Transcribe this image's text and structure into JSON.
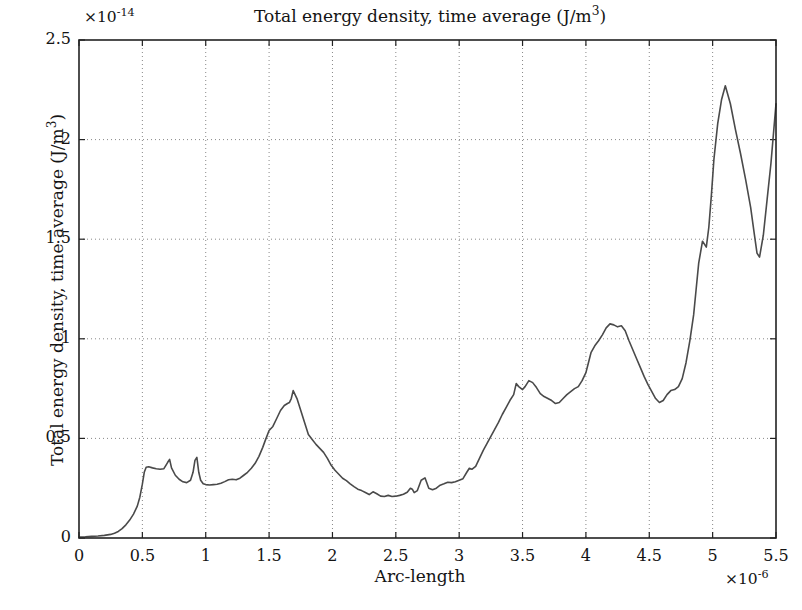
{
  "chart_data": {
    "type": "line",
    "title": "Total energy density, time average (J/m3)",
    "title_html": "Total energy density, time average (J/m<sup>3</sup>)",
    "xlabel": "Arc-length",
    "ylabel": "Total energy density, time average (J/m3)",
    "ylabel_html": "Total energy density, time average (J/m<sup>3</sup>)",
    "x_exponent": "×10⁻⁶",
    "x_exponent_html": "×10<sup>-6</sup>",
    "y_exponent": "×10⁻¹⁴",
    "y_exponent_html": "×10<sup>-14</sup>",
    "xlim": [
      0,
      5.5
    ],
    "ylim": [
      0,
      2.5
    ],
    "xticks": [
      "0",
      "0.5",
      "1",
      "1.5",
      "2",
      "2.5",
      "3",
      "3.5",
      "4",
      "4.5",
      "5",
      "5.5"
    ],
    "xtick_values": [
      0,
      0.5,
      1,
      1.5,
      2,
      2.5,
      3,
      3.5,
      4,
      4.5,
      5,
      5.5
    ],
    "yticks": [
      "0",
      "0.5",
      "1",
      "1.5",
      "2",
      "2.5"
    ],
    "ytick_values": [
      0,
      0.5,
      1,
      1.5,
      2,
      2.5
    ],
    "grid": true,
    "grid_style": "dotted",
    "grid_color": "#888888",
    "line_color": "#4a4a4a",
    "line_width": 1.6,
    "axes_color": "#222222",
    "background": "#ffffff",
    "legend": null,
    "series": [
      {
        "name": "Total energy density",
        "x": [
          0.0,
          0.05,
          0.1,
          0.15,
          0.2,
          0.25,
          0.28,
          0.31,
          0.34,
          0.37,
          0.4,
          0.43,
          0.46,
          0.48,
          0.5,
          0.515,
          0.53,
          0.55,
          0.58,
          0.61,
          0.64,
          0.67,
          0.7,
          0.715,
          0.73,
          0.76,
          0.79,
          0.82,
          0.85,
          0.88,
          0.9,
          0.915,
          0.93,
          0.945,
          0.96,
          0.98,
          1.0,
          1.03,
          1.06,
          1.09,
          1.12,
          1.15,
          1.18,
          1.21,
          1.24,
          1.27,
          1.3,
          1.33,
          1.36,
          1.39,
          1.42,
          1.45,
          1.47,
          1.5,
          1.53,
          1.56,
          1.59,
          1.62,
          1.645,
          1.66,
          1.675,
          1.69,
          1.72,
          1.75,
          1.78,
          1.81,
          1.84,
          1.87,
          1.9,
          1.93,
          1.96,
          1.99,
          2.02,
          2.05,
          2.08,
          2.11,
          2.14,
          2.17,
          2.2,
          2.23,
          2.26,
          2.29,
          2.32,
          2.35,
          2.38,
          2.41,
          2.44,
          2.47,
          2.5,
          2.53,
          2.56,
          2.59,
          2.615,
          2.63,
          2.645,
          2.67,
          2.7,
          2.73,
          2.76,
          2.79,
          2.82,
          2.85,
          2.88,
          2.91,
          2.94,
          2.97,
          3.0,
          3.03,
          3.06,
          3.08,
          3.1,
          3.13,
          3.16,
          3.19,
          3.22,
          3.25,
          3.28,
          3.31,
          3.34,
          3.37,
          3.4,
          3.43,
          3.45,
          3.47,
          3.5,
          3.52,
          3.55,
          3.58,
          3.61,
          3.64,
          3.67,
          3.7,
          3.73,
          3.76,
          3.79,
          3.82,
          3.85,
          3.88,
          3.91,
          3.94,
          3.97,
          4.0,
          4.02,
          4.04,
          4.07,
          4.1,
          4.13,
          4.16,
          4.19,
          4.22,
          4.25,
          4.28,
          4.31,
          4.34,
          4.37,
          4.4,
          4.43,
          4.46,
          4.49,
          4.52,
          4.55,
          4.58,
          4.61,
          4.64,
          4.67,
          4.7,
          4.73,
          4.76,
          4.79,
          4.82,
          4.85,
          4.87,
          4.89,
          4.92,
          4.95,
          4.97,
          4.99,
          5.01,
          5.04,
          5.07,
          5.1,
          5.14,
          5.18,
          5.22,
          5.26,
          5.3,
          5.33,
          5.35,
          5.37,
          5.4,
          5.43,
          5.46,
          5.48,
          5.5
        ],
        "y": [
          0.005,
          0.006,
          0.008,
          0.01,
          0.013,
          0.018,
          0.024,
          0.033,
          0.047,
          0.066,
          0.09,
          0.12,
          0.16,
          0.205,
          0.27,
          0.33,
          0.355,
          0.358,
          0.352,
          0.348,
          0.345,
          0.348,
          0.38,
          0.395,
          0.352,
          0.315,
          0.295,
          0.282,
          0.278,
          0.29,
          0.33,
          0.39,
          0.405,
          0.33,
          0.29,
          0.272,
          0.268,
          0.266,
          0.268,
          0.27,
          0.275,
          0.283,
          0.292,
          0.295,
          0.292,
          0.3,
          0.315,
          0.33,
          0.35,
          0.375,
          0.41,
          0.455,
          0.49,
          0.54,
          0.56,
          0.6,
          0.64,
          0.665,
          0.675,
          0.68,
          0.7,
          0.74,
          0.7,
          0.64,
          0.58,
          0.52,
          0.495,
          0.47,
          0.45,
          0.43,
          0.4,
          0.365,
          0.34,
          0.32,
          0.3,
          0.288,
          0.272,
          0.258,
          0.245,
          0.238,
          0.228,
          0.218,
          0.232,
          0.222,
          0.21,
          0.208,
          0.214,
          0.208,
          0.21,
          0.214,
          0.22,
          0.23,
          0.25,
          0.245,
          0.228,
          0.238,
          0.29,
          0.302,
          0.25,
          0.242,
          0.25,
          0.265,
          0.272,
          0.28,
          0.278,
          0.282,
          0.29,
          0.298,
          0.33,
          0.35,
          0.345,
          0.36,
          0.4,
          0.44,
          0.475,
          0.51,
          0.545,
          0.58,
          0.62,
          0.655,
          0.69,
          0.72,
          0.775,
          0.76,
          0.745,
          0.76,
          0.79,
          0.78,
          0.755,
          0.725,
          0.71,
          0.7,
          0.69,
          0.675,
          0.68,
          0.7,
          0.72,
          0.735,
          0.75,
          0.76,
          0.79,
          0.83,
          0.88,
          0.93,
          0.965,
          0.99,
          1.02,
          1.055,
          1.075,
          1.07,
          1.06,
          1.065,
          1.04,
          0.99,
          0.945,
          0.9,
          0.855,
          0.81,
          0.77,
          0.735,
          0.7,
          0.68,
          0.69,
          0.72,
          0.74,
          0.745,
          0.76,
          0.8,
          0.88,
          0.99,
          1.12,
          1.25,
          1.38,
          1.49,
          1.46,
          1.56,
          1.72,
          1.9,
          2.08,
          2.2,
          2.27,
          2.18,
          2.05,
          1.93,
          1.8,
          1.66,
          1.52,
          1.43,
          1.41,
          1.52,
          1.7,
          1.88,
          2.03,
          2.18
        ]
      }
    ]
  },
  "axes": {
    "xtick_labels": [
      "0",
      "0.5",
      "1",
      "1.5",
      "2",
      "2.5",
      "3",
      "3.5",
      "4",
      "4.5",
      "5",
      "5.5"
    ],
    "ytick_labels": [
      "0",
      "0.5",
      "1",
      "1.5",
      "2",
      "2.5"
    ]
  }
}
